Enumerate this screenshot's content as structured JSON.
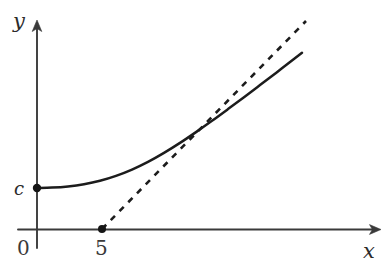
{
  "figure": {
    "background_color": "#ffffff",
    "ink_color": "#1c1c1c",
    "axis_color": "#3a3a3a"
  },
  "axes": {
    "y_axis_label": "y",
    "x_axis_label": "x",
    "origin_label": "0",
    "y_intercept_label": "c",
    "x_intercept_label": "5"
  },
  "chart_data": {
    "type": "line",
    "title": "",
    "xlabel": "x",
    "ylabel": "y",
    "grid": false,
    "legend": null,
    "xlim": [
      0,
      30
    ],
    "ylim": [
      0,
      30
    ],
    "annotations": [
      {
        "name": "y-intercept-dot",
        "label": "c",
        "x": 0,
        "y": 5.2,
        "px": 37,
        "py": 188
      },
      {
        "name": "asymptote-x-intercept-dot",
        "label": "5",
        "x": 5,
        "y": 0,
        "px": 102,
        "py": 229
      }
    ],
    "series": [
      {
        "name": "solid-curve",
        "style": "solid",
        "description": "smooth curve starting at (0, c) with horizontal tangent, increasing and approaching the dashed slant asymptote from above",
        "points_px": [
          [
            37,
            188
          ],
          [
            52,
            187.6
          ],
          [
            68,
            186.4
          ],
          [
            84,
            184.2
          ],
          [
            100,
            180.8
          ],
          [
            116,
            175.9
          ],
          [
            132,
            169.6
          ],
          [
            148,
            161.9
          ],
          [
            164,
            152.9
          ],
          [
            180,
            142.9
          ],
          [
            196,
            132.1
          ],
          [
            212,
            120.8
          ],
          [
            228,
            109.1
          ],
          [
            244,
            97.2
          ],
          [
            260,
            85.1
          ],
          [
            276,
            72.9
          ],
          [
            292,
            60.6
          ],
          [
            302,
            52.8
          ]
        ]
      },
      {
        "name": "dashed-asymptote",
        "style": "dashed",
        "description": "straight dashed line through (5,0) rising to the upper right, asymptote of the solid curve",
        "points_px": [
          [
            102,
            229
          ],
          [
            306,
            21
          ]
        ]
      }
    ]
  }
}
